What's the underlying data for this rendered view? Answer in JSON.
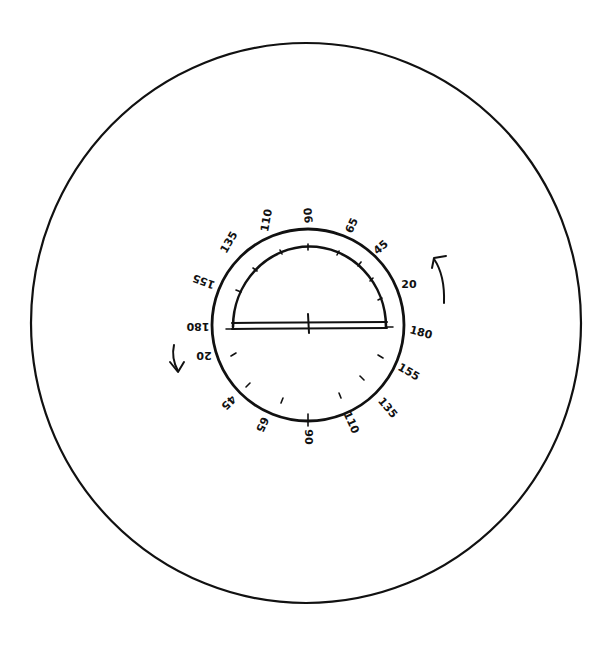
{
  "diagram": {
    "type": "protractor-rotation-sketch",
    "ink_color": "#111111",
    "background": "#ffffff",
    "outer_circle": {
      "cx": 306,
      "cy": 323,
      "rx": 275,
      "ry": 280
    },
    "inner_dial": {
      "cx": 308,
      "cy": 325,
      "r": 96
    },
    "protractor": {
      "cx": 308,
      "cy": 327,
      "r": 76,
      "baseline_label": ""
    },
    "upper_labels": [
      {
        "text": "135",
        "x": 232,
        "y": 244,
        "rot": -60
      },
      {
        "text": "110",
        "x": 270,
        "y": 221,
        "rot": -80
      },
      {
        "text": "90",
        "x": 312,
        "y": 215,
        "rot": -95
      },
      {
        "text": "65",
        "x": 355,
        "y": 227,
        "rot": -65
      },
      {
        "text": "45",
        "x": 383,
        "y": 250,
        "rot": -40
      },
      {
        "text": "20",
        "x": 409,
        "y": 288,
        "rot": 0
      },
      {
        "text": "180",
        "x": 420,
        "y": 336,
        "rot": 15
      },
      {
        "text": "155",
        "x": 407,
        "y": 375,
        "rot": 30
      },
      {
        "text": "135",
        "x": 385,
        "y": 410,
        "rot": 50
      }
    ],
    "lower_labels": [
      {
        "text": "155",
        "x": 205,
        "y": 280,
        "rot": 200
      },
      {
        "text": "180",
        "x": 198,
        "y": 327,
        "rot": 180
      },
      {
        "text": "20",
        "x": 204,
        "y": 356,
        "rot": 180
      },
      {
        "text": "45",
        "x": 226,
        "y": 403,
        "rot": 135
      },
      {
        "text": "65",
        "x": 259,
        "y": 426,
        "rot": 115
      },
      {
        "text": "90",
        "x": 308,
        "y": 437,
        "rot": 90
      },
      {
        "text": "110",
        "x": 350,
        "y": 426,
        "rot": 65
      }
    ],
    "rotation_arrows": [
      {
        "name": "counterclockwise-left",
        "direction": "down"
      },
      {
        "name": "counterclockwise-right",
        "direction": "up"
      }
    ]
  }
}
